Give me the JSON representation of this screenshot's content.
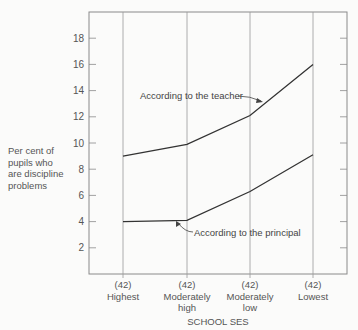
{
  "chart_data": {
    "type": "line",
    "title": "",
    "xlabel": "SCHOOL SES",
    "ylabel": "Per cent of pupils who are discipline problems",
    "ylabel_lines": [
      "Per cent of",
      "pupils who",
      "are discipline",
      "problems"
    ],
    "categories": [
      "Highest",
      "Moderately high",
      "Moderately low",
      "Lowest"
    ],
    "category_lines": [
      [
        "(42)",
        "Highest"
      ],
      [
        "(42)",
        "Moderately",
        "high"
      ],
      [
        "(42)",
        "Moderately",
        "low"
      ],
      [
        "(42)",
        "Lowest"
      ]
    ],
    "n_per_category": [
      42,
      42,
      42,
      42
    ],
    "yticks": [
      2,
      4,
      6,
      8,
      10,
      12,
      14,
      16,
      18
    ],
    "ylim": [
      0,
      20
    ],
    "grid": "vertical lines at categories",
    "legend": "inline annotations",
    "series": [
      {
        "name": "According to the teacher",
        "values": [
          9.0,
          9.9,
          12.1,
          16.0
        ]
      },
      {
        "name": "According to the principal",
        "values": [
          4.0,
          4.1,
          6.3,
          9.1
        ]
      }
    ],
    "annotations": [
      "According to the teacher",
      "According to the principal"
    ]
  },
  "labels": {
    "ylabel": "Per cent of pupils who are discipline problems",
    "xlabel": "SCHOOL SES"
  }
}
